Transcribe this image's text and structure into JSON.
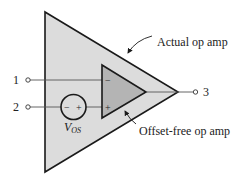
{
  "diagram": {
    "colors": {
      "outer_fill": "#dcdcdc",
      "inner_fill": "#b4b4b4",
      "stroke": "#1a1a1a",
      "background": "#ffffff"
    },
    "outer_opamp": {
      "label": "Actual op amp"
    },
    "inner_opamp": {
      "label": "Offset-free op amp",
      "minus": "−",
      "plus": "+"
    },
    "terminals": [
      {
        "id": "1",
        "label": "1"
      },
      {
        "id": "2",
        "label": "2"
      },
      {
        "id": "3",
        "label": "3"
      }
    ],
    "offset_source": {
      "symbol": "V",
      "subscript": "OS",
      "minus": "−",
      "plus": "+"
    }
  }
}
